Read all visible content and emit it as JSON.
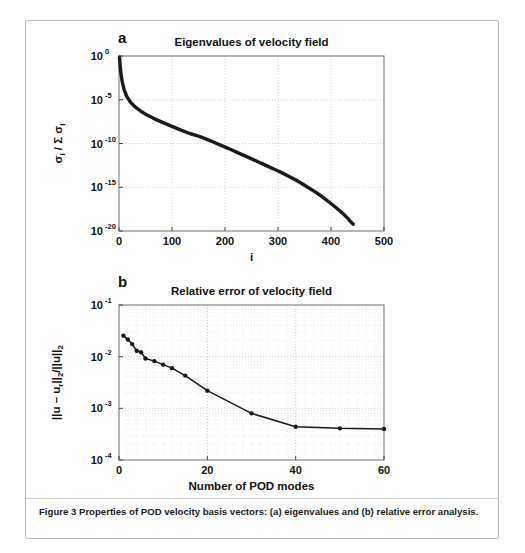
{
  "figure": {
    "caption": "Figure 3 Properties of POD velocity basis vectors: (a) eigenvalues and (b) relative error analysis.",
    "panel_a_letter": "a",
    "panel_b_letter": "b",
    "border_color": "#b9b9b9",
    "line_color": "#1a1a1a",
    "grid_color": "#bdbdbd"
  },
  "chart_data": [
    {
      "type": "line",
      "id": "eigenvalues",
      "title": "Eigenvalues of velocity field",
      "xlabel": "i",
      "ylabel": "σi / Σ σi",
      "ylabel_parts": {
        "numerator": "σ",
        "sub1": "i",
        "sum": "/ Σ",
        "denominator": "σ",
        "sub2": "i"
      },
      "xlim": [
        0,
        500
      ],
      "ylim": [
        1e-20,
        1
      ],
      "yscale": "log",
      "xscale": "linear",
      "grid": true,
      "legend": "none",
      "xticks": [
        0,
        100,
        200,
        300,
        400,
        500
      ],
      "xtick_labels": [
        "0",
        "100",
        "200",
        "300",
        "400",
        "500"
      ],
      "yticks": [
        1,
        1e-05,
        1e-10,
        1e-15,
        1e-20
      ],
      "ytick_labels": [
        "10^0",
        "10^-5",
        "10^-10",
        "10^-15",
        "10^-20"
      ],
      "ytick_mantissa": [
        "10",
        "10",
        "10",
        "10",
        "10"
      ],
      "ytick_exponents": [
        "0",
        "-5",
        "-10",
        "-15",
        "-20"
      ],
      "x": [
        1,
        3,
        6,
        10,
        15,
        22,
        30,
        40,
        52,
        66,
        82,
        100,
        118,
        135,
        150,
        165,
        180,
        196,
        212,
        228,
        244,
        260,
        276,
        292,
        306,
        320,
        332,
        344,
        356,
        368,
        378,
        388,
        398,
        408,
        416,
        424,
        430,
        435,
        439,
        442
      ],
      "y": [
        0.72,
        0.02,
        0.0012,
        0.00012,
        2.2e-05,
        5e-06,
        1.6e-06,
        5.5e-07,
        1.9e-07,
        7e-08,
        2.6e-08,
        9e-09,
        3.2e-09,
        1.3e-09,
        7e-10,
        3.2e-10,
        1.3e-10,
        5e-11,
        1.9e-11,
        7e-12,
        2.6e-12,
        9.5e-13,
        3.4e-13,
        1.2e-13,
        5e-14,
        1.8e-14,
        7.5e-15,
        2.9e-15,
        1e-15,
        3.6e-16,
        1.4e-16,
        5e-17,
        1.7e-17,
        5.5e-18,
        2.2e-18,
        8e-19,
        3.5e-19,
        1.6e-19,
        9e-20,
        6e-20
      ]
    },
    {
      "type": "line",
      "id": "relative-error",
      "title": "Relative error of velocity field",
      "xlabel": "Number of POD modes",
      "ylabel": "||u – ur||2/||u||2",
      "ylabel_parts": {
        "p1": "||u – u",
        "sub1": "r",
        "p2": "||",
        "sub2": "2",
        "p3": "/||u||",
        "sub3": "2"
      },
      "xlim": [
        0,
        60
      ],
      "ylim": [
        0.0001,
        0.1
      ],
      "yscale": "log",
      "xscale": "linear",
      "grid": true,
      "legend": "none",
      "xticks": [
        0,
        20,
        40,
        60
      ],
      "xtick_labels": [
        "0",
        "20",
        "40",
        "60"
      ],
      "yticks": [
        0.1,
        0.01,
        0.001,
        0.0001
      ],
      "ytick_labels": [
        "10^-1",
        "10^-2",
        "10^-3",
        "10^-4"
      ],
      "ytick_mantissa": [
        "10",
        "10",
        "10",
        "10"
      ],
      "ytick_exponents": [
        "-1",
        "-2",
        "-3",
        "-4"
      ],
      "markers": true,
      "x": [
        1,
        2,
        3,
        4,
        5,
        6,
        8,
        10,
        12,
        15,
        20,
        30,
        40,
        50,
        60
      ],
      "y": [
        0.0255,
        0.0215,
        0.0175,
        0.013,
        0.0122,
        0.0092,
        0.0082,
        0.007,
        0.006,
        0.0043,
        0.0022,
        0.0008,
        0.00044,
        0.00041,
        0.0004
      ]
    }
  ]
}
